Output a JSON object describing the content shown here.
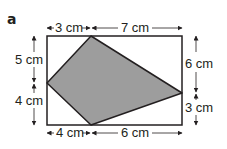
{
  "part_label": "a",
  "colors": {
    "stroke": "#231f20",
    "fill": "#9d9d9d",
    "background": "#ffffff"
  },
  "rectangle": {
    "x": 47,
    "y": 36,
    "width": 135,
    "height": 89
  },
  "shaded_quadrilateral": {
    "points": "91,36 182,93 91,125 47,83"
  },
  "dimensions": {
    "top_left": "3 cm",
    "top_right": "7 cm",
    "left_upper": "5 cm",
    "left_lower": "4 cm",
    "right_upper": "6 cm",
    "right_lower": "3 cm",
    "bottom_left": "4 cm",
    "bottom_right": "6 cm"
  }
}
